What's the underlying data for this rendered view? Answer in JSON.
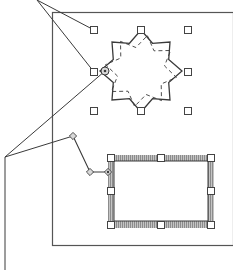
{
  "diagram": {
    "colors": {
      "line": "#3a3a3a",
      "page_border": "#555555",
      "handle_fill": "#ffffff",
      "handle_stroke": "#444444",
      "hatch": "#9a9a9a",
      "diamond_fill": "#d8d8d8"
    },
    "page": {
      "x": 52,
      "y": 12,
      "width": 181,
      "height": 233
    },
    "star": {
      "center": [
        141,
        71
      ],
      "outer_radius": 41,
      "inner_radius": 30,
      "points": 8,
      "handles": [
        [
          94,
          30
        ],
        [
          141,
          30
        ],
        [
          188,
          30
        ],
        [
          94,
          72
        ],
        [
          188,
          72
        ],
        [
          94,
          111
        ],
        [
          141,
          111
        ],
        [
          188,
          111
        ]
      ],
      "center_knob": [
        105,
        71
      ]
    },
    "rectangle": {
      "outer": {
        "x": 108,
        "y": 155,
        "width": 106,
        "height": 73
      },
      "inner": {
        "x": 114,
        "y": 161,
        "width": 94,
        "height": 60
      },
      "handles": [
        [
          111,
          158
        ],
        [
          161,
          158
        ],
        [
          211,
          158
        ],
        [
          111,
          191
        ],
        [
          211,
          191
        ],
        [
          111,
          225
        ],
        [
          161,
          225
        ],
        [
          211,
          225
        ]
      ]
    },
    "polyline": {
      "points": [
        [
          73,
          136
        ],
        [
          90,
          172
        ],
        [
          108,
          172
        ]
      ]
    },
    "callouts": {
      "top": {
        "origin": [
          37,
          0
        ],
        "targets": [
          [
            94,
            30
          ],
          [
            94,
            72
          ]
        ]
      },
      "bottom": {
        "vertex": [
          5,
          157
        ],
        "end": [
          5,
          270
        ],
        "targets": [
          [
            73,
            136
          ],
          [
            105,
            71
          ]
        ]
      }
    }
  }
}
